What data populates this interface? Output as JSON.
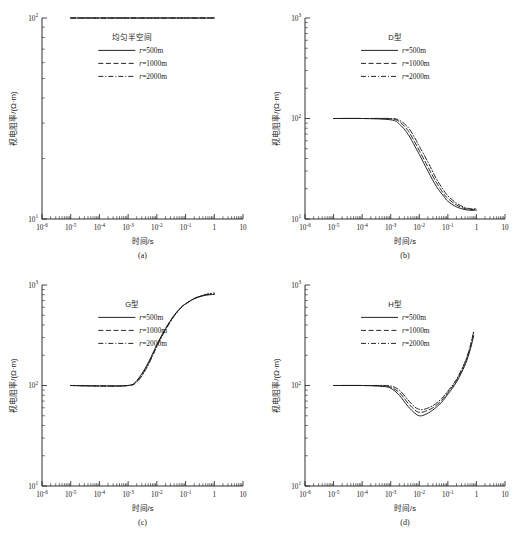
{
  "figure": {
    "axis_x_title": "时间/s",
    "axis_y_title": "视电阻率/(Ω·m)",
    "x_tick_labels": [
      "10⁻⁶",
      "10⁻⁵",
      "10⁻⁴",
      "10⁻³",
      "10⁻²",
      "10⁻¹",
      "1",
      "10"
    ],
    "series_labels": [
      "r=500m",
      "r=1000m",
      "r=2000m"
    ],
    "line_styles": [
      "solid",
      "dashed",
      "dash-dot"
    ],
    "line_color": "#1a1a1a",
    "background_color": "#ffffff"
  },
  "panels": [
    {
      "caption": "(a)",
      "legend_title": "均匀半空间",
      "y_tick_labels": [
        "10¹",
        "10²"
      ]
    },
    {
      "caption": "(b)",
      "legend_title": "D型",
      "y_tick_labels": [
        "10¹",
        "10²",
        "10³"
      ]
    },
    {
      "caption": "(c)",
      "legend_title": "G型",
      "y_tick_labels": [
        "10¹",
        "10²",
        "10³"
      ]
    },
    {
      "caption": "(d)",
      "legend_title": "H型",
      "y_tick_labels": [
        "10¹",
        "10²",
        "10³"
      ]
    }
  ],
  "chart_data": [
    {
      "type": "line",
      "panel": "(a)",
      "title": "均匀半空间",
      "xlabel": "时间/s",
      "ylabel": "视电阻率/(Ω·m)",
      "xscale": "log",
      "yscale": "log",
      "xlim": [
        1e-06,
        10
      ],
      "ylim": [
        10,
        100
      ],
      "grid": false,
      "legend_position": "upper-center",
      "series": [
        {
          "name": "r=500m",
          "style": "solid",
          "x": [
            1e-05,
            3e-05,
            0.0001,
            0.0003,
            0.001,
            0.003,
            0.01,
            0.03,
            0.1,
            0.3,
            1
          ],
          "y": [
            100,
            100,
            100,
            100,
            100,
            100,
            100,
            100,
            100,
            100,
            100
          ]
        },
        {
          "name": "r=1000m",
          "style": "dashed",
          "x": [
            1e-05,
            3e-05,
            0.0001,
            0.0003,
            0.001,
            0.003,
            0.01,
            0.03,
            0.1,
            0.3,
            1
          ],
          "y": [
            100,
            100,
            100,
            100,
            100,
            100,
            100,
            100,
            100,
            100,
            100
          ]
        },
        {
          "name": "r=2000m",
          "style": "dash-dot",
          "x": [
            1e-05,
            3e-05,
            0.0001,
            0.0003,
            0.001,
            0.003,
            0.01,
            0.03,
            0.1,
            0.3,
            1
          ],
          "y": [
            100,
            100,
            100,
            100,
            100,
            100,
            100,
            100,
            100,
            100,
            100
          ]
        }
      ]
    },
    {
      "type": "line",
      "panel": "(b)",
      "title": "D型",
      "xlabel": "时间/s",
      "ylabel": "视电阻率/(Ω·m)",
      "xscale": "log",
      "yscale": "log",
      "xlim": [
        1e-06,
        10
      ],
      "ylim": [
        10,
        1000
      ],
      "grid": false,
      "legend_position": "upper-center",
      "series": [
        {
          "name": "r=500m",
          "style": "solid",
          "x": [
            1e-05,
            0.0001,
            0.001,
            0.002,
            0.004,
            0.007,
            0.01,
            0.02,
            0.04,
            0.07,
            0.1,
            0.2,
            0.4,
            0.7,
            1
          ],
          "y": [
            100,
            100,
            97,
            88,
            70,
            53,
            44,
            30,
            21,
            17,
            15,
            13.2,
            12.4,
            12.2,
            12.3
          ]
        },
        {
          "name": "r=1000m",
          "style": "dashed",
          "x": [
            1e-05,
            0.0001,
            0.001,
            0.002,
            0.004,
            0.007,
            0.01,
            0.02,
            0.04,
            0.07,
            0.1,
            0.2,
            0.4,
            0.7,
            1
          ],
          "y": [
            100,
            100,
            99,
            93,
            76,
            58,
            48,
            33,
            23,
            18,
            16,
            13.8,
            12.7,
            12.4,
            12.5
          ]
        },
        {
          "name": "r=2000m",
          "style": "dash-dot",
          "x": [
            1e-05,
            0.0001,
            0.001,
            0.002,
            0.004,
            0.007,
            0.01,
            0.02,
            0.04,
            0.07,
            0.1,
            0.2,
            0.4,
            0.7,
            1
          ],
          "y": [
            100,
            100,
            100,
            96,
            82,
            64,
            53,
            37,
            25,
            19.5,
            17,
            14.4,
            13.0,
            12.6,
            12.7
          ]
        }
      ]
    },
    {
      "type": "line",
      "panel": "(c)",
      "title": "G型",
      "xlabel": "时间/s",
      "ylabel": "视电阻率/(Ω·m)",
      "xscale": "log",
      "yscale": "log",
      "xlim": [
        1e-06,
        10
      ],
      "ylim": [
        10,
        1000
      ],
      "grid": false,
      "legend_position": "upper-center",
      "series": [
        {
          "name": "r=500m",
          "style": "solid",
          "x": [
            1e-05,
            0.0001,
            0.001,
            0.002,
            0.004,
            0.007,
            0.01,
            0.02,
            0.04,
            0.07,
            0.1,
            0.2,
            0.4,
            0.7,
            1
          ],
          "y": [
            100,
            99,
            100,
            112,
            150,
            205,
            255,
            370,
            500,
            600,
            650,
            730,
            780,
            800,
            805
          ]
        },
        {
          "name": "r=1000m",
          "style": "dashed",
          "x": [
            1e-05,
            0.0001,
            0.001,
            0.002,
            0.004,
            0.007,
            0.01,
            0.02,
            0.04,
            0.07,
            0.1,
            0.2,
            0.4,
            0.7,
            1
          ],
          "y": [
            100,
            99,
            100,
            110,
            146,
            200,
            250,
            363,
            495,
            597,
            648,
            732,
            785,
            810,
            818
          ]
        },
        {
          "name": "r=2000m",
          "style": "dash-dot",
          "x": [
            1e-05,
            0.0001,
            0.001,
            0.002,
            0.004,
            0.007,
            0.01,
            0.02,
            0.04,
            0.07,
            0.1,
            0.2,
            0.4,
            0.7,
            1
          ],
          "y": [
            100,
            99,
            100,
            108,
            142,
            195,
            244,
            356,
            489,
            593,
            645,
            735,
            792,
            822,
            832
          ]
        }
      ]
    },
    {
      "type": "line",
      "panel": "(d)",
      "title": "H型",
      "xlabel": "时间/s",
      "ylabel": "视电阻率/(Ω·m)",
      "xscale": "log",
      "yscale": "log",
      "xlim": [
        1e-06,
        10
      ],
      "ylim": [
        10,
        1000
      ],
      "grid": false,
      "legend_position": "upper-center",
      "series": [
        {
          "name": "r=500m",
          "style": "solid",
          "x": [
            1e-05,
            0.0001,
            0.0005,
            0.001,
            0.002,
            0.004,
            0.007,
            0.01,
            0.015,
            0.03,
            0.06,
            0.1,
            0.2,
            0.4,
            0.6,
            0.8
          ],
          "y": [
            100,
            100,
            98,
            94,
            80,
            62,
            53,
            50,
            51,
            57,
            68,
            82,
            108,
            160,
            225,
            310
          ]
        },
        {
          "name": "r=1000m",
          "style": "dashed",
          "x": [
            1e-05,
            0.0001,
            0.0005,
            0.001,
            0.002,
            0.004,
            0.007,
            0.01,
            0.015,
            0.03,
            0.06,
            0.1,
            0.2,
            0.4,
            0.6,
            0.8
          ],
          "y": [
            100,
            100,
            99,
            96,
            85,
            67,
            57,
            54,
            55,
            60,
            71,
            85,
            112,
            168,
            238,
            335
          ]
        },
        {
          "name": "r=2000m",
          "style": "dash-dot",
          "x": [
            1e-05,
            0.0001,
            0.0005,
            0.001,
            0.002,
            0.004,
            0.007,
            0.01,
            0.015,
            0.03,
            0.06,
            0.1,
            0.2,
            0.4,
            0.6,
            0.8
          ],
          "y": [
            100,
            100,
            100,
            99,
            90,
            72,
            61,
            58,
            58,
            63,
            74,
            88,
            115,
            172,
            244,
            345
          ]
        }
      ]
    }
  ]
}
